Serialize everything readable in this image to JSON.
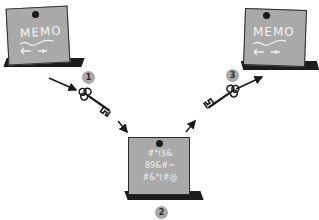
{
  "diagram": {
    "notes": [
      {
        "id": "plaintext-memo-1",
        "title": "MEMO",
        "symbols": "⟵ ⤙"
      },
      {
        "id": "ciphertext-memo",
        "lines": [
          "#*($&",
          "89&#~",
          "#&*(#@"
        ]
      },
      {
        "id": "plaintext-memo-2",
        "title": "MEMO",
        "symbols": "⟵ ⤙"
      }
    ],
    "steps": [
      {
        "number": "1",
        "label": "encrypt-key"
      },
      {
        "number": "2",
        "label": "ciphertext"
      },
      {
        "number": "3",
        "label": "decrypt-key"
      }
    ],
    "colors": {
      "note_face": "#a9a9a9",
      "note_back": "#1c1c1c",
      "badge": "#a8a8a8",
      "arrow": "#1a1a1a"
    }
  }
}
